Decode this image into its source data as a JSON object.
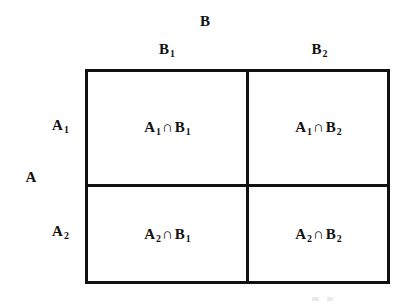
{
  "figure": {
    "type": "partition-table",
    "background_color": "#ffffff",
    "line_color": "#111111",
    "text_color": "#111111"
  },
  "headers": {
    "column_super_label": "B",
    "row_super_label": "A",
    "columns": [
      {
        "base": "B",
        "sub": "1"
      },
      {
        "base": "B",
        "sub": "2"
      }
    ],
    "rows": [
      {
        "base": "A",
        "sub": "1"
      },
      {
        "base": "A",
        "sub": "2"
      }
    ]
  },
  "symbols": {
    "intersection": "∩"
  },
  "cells": [
    {
      "id": "cell-11",
      "row": 1,
      "column": 1,
      "left_base": "A",
      "left_sub": "1",
      "operator": "∩",
      "right_base": "B",
      "right_sub": "1"
    },
    {
      "id": "cell-12",
      "row": 1,
      "column": 2,
      "left_base": "A",
      "left_sub": "1",
      "operator": "∩",
      "right_base": "B",
      "right_sub": "2"
    },
    {
      "id": "cell-21",
      "row": 2,
      "column": 1,
      "left_base": "A",
      "left_sub": "2",
      "operator": "∩",
      "right_base": "B",
      "right_sub": "1"
    },
    {
      "id": "cell-22",
      "row": 2,
      "column": 2,
      "left_base": "A",
      "left_sub": "2",
      "operator": "∩",
      "right_base": "B",
      "right_sub": "2"
    }
  ]
}
